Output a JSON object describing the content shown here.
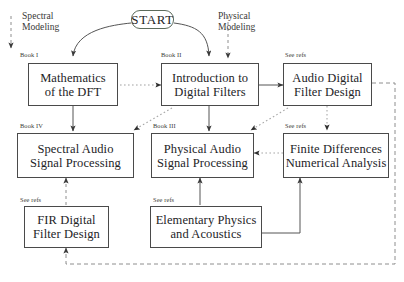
{
  "diagram": {
    "start": {
      "label": "START"
    },
    "lanes": [
      {
        "name": "spectral-modeling",
        "line1": "Spectral",
        "line2": "Modeling"
      },
      {
        "name": "physical-modeling",
        "line1": "Physical",
        "line2": "Modeling"
      }
    ],
    "nodes": [
      {
        "id": "math-dft",
        "tag": "Book I",
        "line1": "Mathematics",
        "line2": "of the DFT"
      },
      {
        "id": "intro-filters",
        "tag": "Book II",
        "line1": "Introduction to",
        "line2": "Digital Filters"
      },
      {
        "id": "audio-filter",
        "tag": "See refs",
        "line1": "Audio Digital",
        "line2": "Filter Design"
      },
      {
        "id": "spectral-audio",
        "tag": "Book IV",
        "line1": "Spectral Audio",
        "line2": "Signal Processing"
      },
      {
        "id": "physical-audio",
        "tag": "Book III",
        "line1": "Physical Audio",
        "line2": "Signal Processing"
      },
      {
        "id": "finite-diff",
        "tag": "See refs",
        "line1": "Finite Differences",
        "line2": "Numerical Analysis"
      },
      {
        "id": "fir-filter",
        "tag": "See refs",
        "line1": "FIR Digital",
        "line2": "Filter Design"
      },
      {
        "id": "elem-physics",
        "tag": "See refs",
        "line1": "Elementary Physics",
        "line2": "and Acoustics"
      }
    ],
    "colors": {
      "box_border": "#4a4a4a",
      "start_border": "#5c6b5c",
      "solid_edge": "#555555",
      "dotted_edge": "#9a9a9a",
      "dashed_edge": "#8a8a8a",
      "text": "#23231f",
      "background": "#ffffff"
    }
  }
}
